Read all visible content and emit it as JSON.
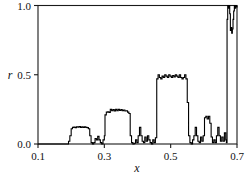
{
  "chart_data": {
    "type": "line",
    "title": "",
    "xlabel": "x",
    "ylabel": "r",
    "xlim": [
      0.1,
      0.7
    ],
    "ylim": [
      0.0,
      1.0
    ],
    "grid": false,
    "legend": null,
    "xticks": [
      0.1,
      0.3,
      0.5,
      0.7
    ],
    "xticklabels": [
      "0.1",
      "0.3",
      "0.5",
      "0.7"
    ],
    "yticks": [
      0.0,
      0.5,
      1.0
    ],
    "yticklabels": [
      "0.0",
      "0.5",
      "1.0"
    ],
    "series": [
      {
        "name": "winding number r(x)",
        "color": "#000000",
        "step": "post",
        "x": [
          0.1,
          0.19,
          0.192,
          0.196,
          0.2,
          0.204,
          0.208,
          0.212,
          0.216,
          0.22,
          0.224,
          0.228,
          0.232,
          0.236,
          0.24,
          0.244,
          0.248,
          0.252,
          0.256,
          0.26,
          0.264,
          0.268,
          0.272,
          0.276,
          0.28,
          0.284,
          0.288,
          0.292,
          0.296,
          0.3,
          0.302,
          0.306,
          0.31,
          0.314,
          0.318,
          0.322,
          0.326,
          0.33,
          0.334,
          0.338,
          0.342,
          0.346,
          0.35,
          0.354,
          0.358,
          0.362,
          0.366,
          0.37,
          0.374,
          0.378,
          0.382,
          0.386,
          0.39,
          0.394,
          0.398,
          0.402,
          0.406,
          0.41,
          0.414,
          0.418,
          0.422,
          0.426,
          0.43,
          0.434,
          0.438,
          0.442,
          0.446,
          0.45,
          0.454,
          0.458,
          0.462,
          0.466,
          0.47,
          0.474,
          0.478,
          0.482,
          0.486,
          0.49,
          0.494,
          0.498,
          0.502,
          0.506,
          0.51,
          0.514,
          0.518,
          0.522,
          0.526,
          0.53,
          0.534,
          0.538,
          0.542,
          0.546,
          0.55,
          0.554,
          0.558,
          0.562,
          0.566,
          0.57,
          0.574,
          0.578,
          0.582,
          0.586,
          0.59,
          0.594,
          0.598,
          0.602,
          0.606,
          0.61,
          0.614,
          0.618,
          0.622,
          0.626,
          0.63,
          0.634,
          0.638,
          0.642,
          0.646,
          0.65,
          0.654,
          0.658,
          0.662,
          0.666,
          0.668,
          0.67,
          0.672,
          0.674,
          0.676,
          0.678,
          0.68,
          0.682,
          0.684,
          0.686,
          0.688,
          0.69,
          0.692,
          0.694,
          0.696,
          0.698,
          0.7
        ],
        "y": [
          0.0,
          0.0,
          0.02,
          0.06,
          0.11,
          0.12,
          0.122,
          0.118,
          0.125,
          0.122,
          0.126,
          0.12,
          0.124,
          0.12,
          0.124,
          0.12,
          0.118,
          0.11,
          0.06,
          0.01,
          0.0,
          0.01,
          0.04,
          0.03,
          0.055,
          0.03,
          0.01,
          0.0,
          0.03,
          0.06,
          0.21,
          0.23,
          0.232,
          0.228,
          0.25,
          0.24,
          0.248,
          0.238,
          0.25,
          0.24,
          0.25,
          0.242,
          0.248,
          0.24,
          0.246,
          0.238,
          0.24,
          0.23,
          0.22,
          0.06,
          0.01,
          0.0,
          0.005,
          0.03,
          0.01,
          0.06,
          0.12,
          0.06,
          0.02,
          0.01,
          0.05,
          0.02,
          0.06,
          0.03,
          0.01,
          0.0,
          0.03,
          0.01,
          0.045,
          0.47,
          0.5,
          0.48,
          0.47,
          0.49,
          0.48,
          0.5,
          0.49,
          0.48,
          0.5,
          0.49,
          0.48,
          0.495,
          0.485,
          0.5,
          0.49,
          0.48,
          0.5,
          0.48,
          0.47,
          0.48,
          0.5,
          0.47,
          0.3,
          0.06,
          0.01,
          0.0,
          0.03,
          0.06,
          0.12,
          0.06,
          0.02,
          0.01,
          0.05,
          0.02,
          0.06,
          0.19,
          0.2,
          0.18,
          0.2,
          0.15,
          0.05,
          0.01,
          0.03,
          0.01,
          0.06,
          0.12,
          0.06,
          0.02,
          0.05,
          0.02,
          0.08,
          0.03,
          0.01,
          0.9,
          1.0,
          0.98,
          1.0,
          0.94,
          0.82,
          0.84,
          0.8,
          0.83,
          0.9,
          0.96,
          1.0,
          0.98,
          1.0,
          0.99,
          1.0
        ]
      }
    ]
  },
  "axes": {
    "ylabel_text": "r",
    "xlabel_text": "x"
  }
}
